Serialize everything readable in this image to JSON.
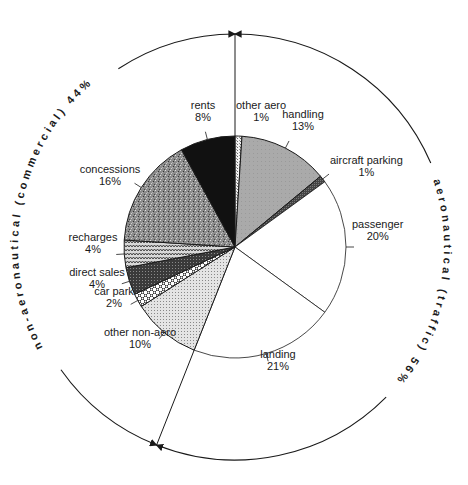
{
  "chart_data": {
    "type": "pie",
    "title": "",
    "start_angle_deg": 0,
    "direction": "clockwise",
    "slices": [
      {
        "label": "other aero",
        "value": 1,
        "pct_text": "1%",
        "group": "aeronautical",
        "pattern": "crosshatch-light",
        "label_x": 236,
        "label_y": 121,
        "anchor": "start",
        "leader": false
      },
      {
        "label": "handling",
        "value": 13,
        "pct_text": "13%",
        "group": "aeronautical",
        "pattern": "gray-mid",
        "label_x": 303,
        "label_y": 130,
        "anchor": "middle",
        "leader": true
      },
      {
        "label": "aircraft parking",
        "value": 1,
        "pct_text": "1%",
        "group": "aeronautical",
        "pattern": "dark-gray",
        "label_x": 330,
        "label_y": 176,
        "anchor": "start",
        "leader": true
      },
      {
        "label": "passenger",
        "value": 20,
        "pct_text": "20%",
        "group": "aeronautical",
        "pattern": "white",
        "label_x": 352,
        "label_y": 240,
        "anchor": "start",
        "leader": true
      },
      {
        "label": "landing",
        "value": 21,
        "pct_text": "21%",
        "group": "aeronautical",
        "pattern": "white",
        "label_x": 278,
        "label_y": 370,
        "anchor": "middle",
        "leader": true
      },
      {
        "label": "other non-aero",
        "value": 10,
        "pct_text": "10%",
        "group": "non-aeronautical",
        "pattern": "dots-light",
        "label_x": 140,
        "label_y": 348,
        "anchor": "middle",
        "leader": true
      },
      {
        "label": "car park",
        "value": 2,
        "pct_text": "2%",
        "group": "non-aeronautical",
        "pattern": "checker",
        "label_x": 114,
        "label_y": 307,
        "anchor": "middle",
        "leader": true
      },
      {
        "label": "direct sales",
        "value": 4,
        "pct_text": "4%",
        "group": "non-aeronautical",
        "pattern": "dark-stipple",
        "label_x": 97,
        "label_y": 288,
        "anchor": "middle",
        "leader": true
      },
      {
        "label": "recharges",
        "value": 4,
        "pct_text": "4%",
        "group": "non-aeronautical",
        "pattern": "zigzag",
        "label_x": 93,
        "label_y": 253,
        "anchor": "middle",
        "leader": true
      },
      {
        "label": "concessions",
        "value": 16,
        "pct_text": "16%",
        "group": "non-aeronautical",
        "pattern": "granite",
        "label_x": 110,
        "label_y": 185,
        "anchor": "middle",
        "leader": true
      },
      {
        "label": "rents",
        "value": 8,
        "pct_text": "8%",
        "group": "non-aeronautical",
        "pattern": "black",
        "label_x": 203,
        "label_y": 121,
        "anchor": "middle",
        "leader": true
      }
    ],
    "groups": [
      {
        "name": "aeronautical",
        "arc_label": "aeronautical (traffic) 56%",
        "value": 56
      },
      {
        "name": "non-aeronautical",
        "arc_label": "non-aeronautical (commercial) 44%",
        "value": 44
      }
    ],
    "geometry": {
      "cx": 235,
      "cy": 247,
      "r": 111,
      "outer_r": 213
    },
    "colors": {
      "ink": "#1a1a1a",
      "background": "#ffffff",
      "gray_mid": "#a8a8a8",
      "dark_gray": "#555555",
      "black": "#111111"
    }
  }
}
